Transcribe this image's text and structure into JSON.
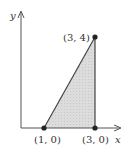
{
  "diagram": {
    "type": "shaded-triangle-region",
    "axes": {
      "x_label": "x",
      "y_label": "y"
    },
    "vertices": [
      {
        "label": "(1, 0)",
        "x": 1,
        "y": 0
      },
      {
        "label": "(3, 0)",
        "x": 3,
        "y": 0
      },
      {
        "label": "(3, 4)",
        "x": 3,
        "y": 4
      }
    ],
    "colors": {
      "fill": "#d9d9d9",
      "stroke": "#444444",
      "axis": "#555555",
      "point": "#222222"
    }
  }
}
